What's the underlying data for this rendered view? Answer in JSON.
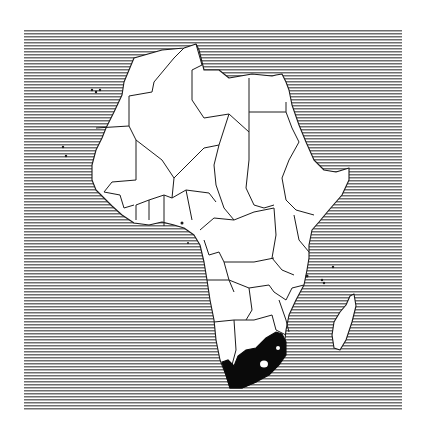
{
  "map": {
    "subject": "Map of Africa with political borders",
    "region": "Africa",
    "highlighted_country": "South Africa",
    "style": {
      "ocean_pattern": "horizontal-hatching",
      "ocean_line_color": "#6e6e6e",
      "land_fill": "#ffffff",
      "border_color": "#1a1a1a",
      "highlight_fill": "#0a0a0a",
      "background": "#ffffff"
    },
    "islands": [
      "Madagascar",
      "Canary Islands",
      "Cape Verde",
      "Comoros",
      "Zanzibar",
      "Bioko",
      "São Tomé"
    ]
  }
}
